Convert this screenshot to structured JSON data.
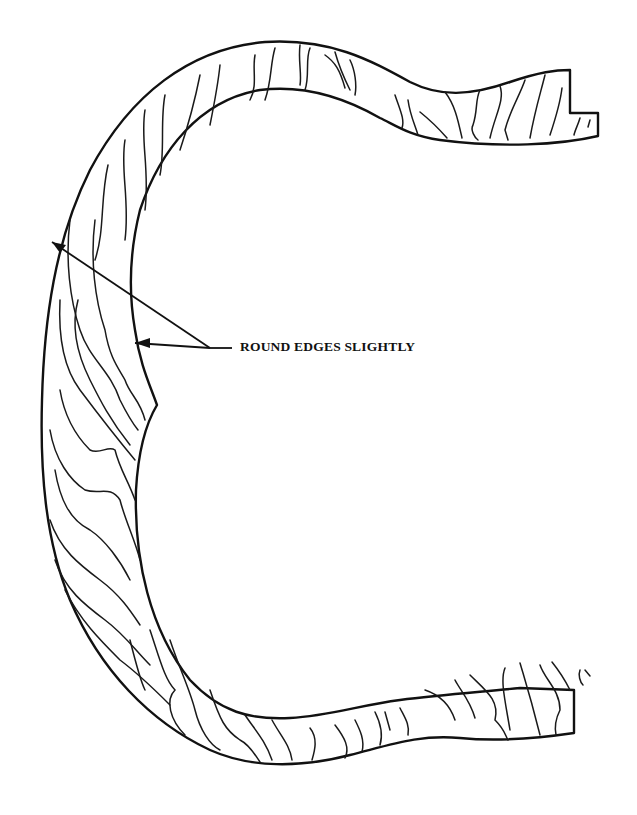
{
  "diagram": {
    "callout": {
      "text": "ROUND EDGES SLIGHTLY",
      "targets": [
        "outer edge",
        "inner edge"
      ]
    },
    "colors": {
      "line": "#111111",
      "background": "#ffffff"
    }
  }
}
